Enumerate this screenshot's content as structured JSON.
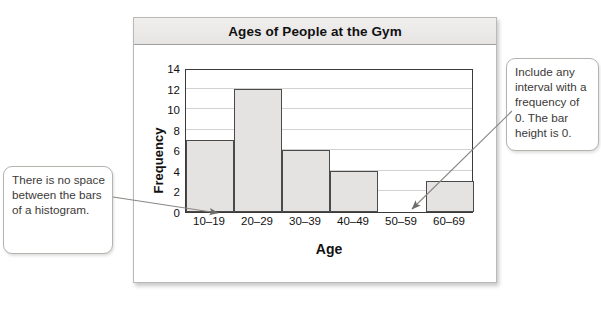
{
  "chart_panel": {
    "title": "Ages of People at the Gym"
  },
  "callouts": {
    "left": "There is no space between the bars of a histogram.",
    "right": "Include any interval with a frequency of 0. The bar height is 0."
  },
  "chart_data": {
    "type": "bar",
    "title": "Ages of People at the Gym",
    "xlabel": "Age",
    "ylabel": "Frequency",
    "categories": [
      "10–19",
      "20–29",
      "30–39",
      "40–49",
      "50–59",
      "60–69"
    ],
    "values": [
      7,
      12,
      6,
      4,
      0,
      3
    ],
    "yticks": [
      0,
      2,
      4,
      6,
      8,
      10,
      12,
      14
    ],
    "ylim": [
      0,
      14
    ],
    "grid": true,
    "legend": false,
    "bar_fill": "#e4e3e1",
    "bar_stroke": "#4a4a4a",
    "gap": 0
  }
}
